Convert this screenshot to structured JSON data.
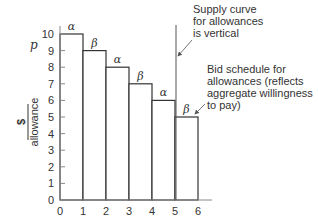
{
  "chart_data": {
    "type": "bar",
    "title": "",
    "xlabel": "",
    "ylabel_numerator": "$",
    "ylabel_denominator": "allowance",
    "price_symbol": "p",
    "categories": [
      "0-1",
      "1-2",
      "2-3",
      "3-4",
      "4-5",
      "5-6"
    ],
    "values": [
      10,
      9,
      8,
      7,
      6,
      5
    ],
    "bar_labels": [
      "α",
      "β",
      "α",
      "β",
      "α",
      "β"
    ],
    "x_ticks": [
      "0",
      "1",
      "2",
      "3",
      "4",
      "5",
      "6"
    ],
    "y_ticks": [
      "0",
      "1",
      "2",
      "3",
      "4",
      "5",
      "6",
      "7",
      "8",
      "9",
      "10"
    ],
    "xlim": [
      0,
      6.5
    ],
    "ylim": [
      0,
      10
    ],
    "supply_curve_x": 5,
    "grid": false,
    "annotations": [
      {
        "text_lines": [
          "Supply curve",
          "for allowances",
          "is vertical"
        ],
        "points_to": "supply-line"
      },
      {
        "text_lines": [
          "Bid schedule for",
          "allowances (reflects",
          "aggregate willingness",
          "to pay)"
        ],
        "points_to": "bid-schedule"
      }
    ]
  },
  "colors": {
    "line": "#333333",
    "axis": "#999999",
    "bar_fill": "#ffffff"
  }
}
